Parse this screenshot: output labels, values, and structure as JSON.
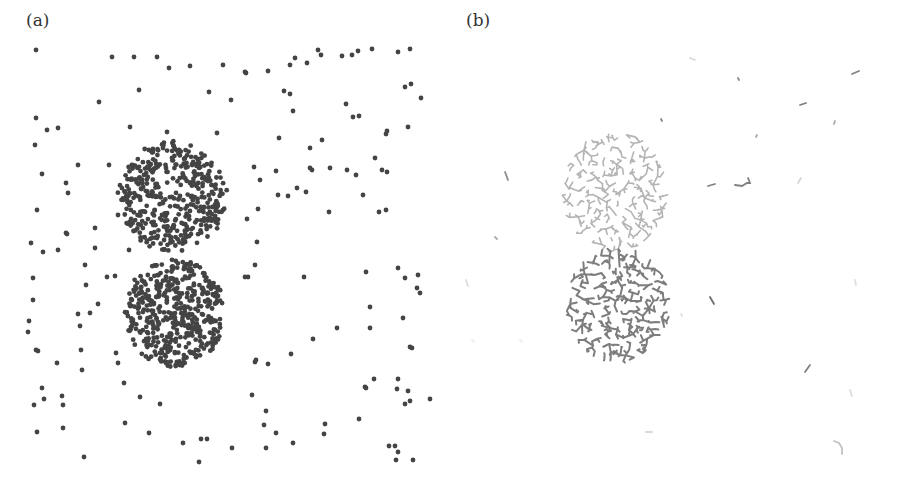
{
  "figure": {
    "panels": [
      {
        "id": "a",
        "label": "(a)"
      },
      {
        "id": "b",
        "label": "(b)"
      }
    ]
  },
  "chart_data": [
    {
      "panel": "(a)",
      "type": "scatter",
      "title": "",
      "xlabel": "",
      "ylabel": "",
      "axes_visible": false,
      "grid": false,
      "point_color": "#444444",
      "point_radius": 2.4,
      "clusters": [
        {
          "name": "upper-cluster",
          "cx": 172,
          "cy": 197,
          "rx": 55,
          "ry": 56,
          "count": 430,
          "seed": 11
        },
        {
          "name": "lower-cluster",
          "cx": 175,
          "cy": 313,
          "rx": 51,
          "ry": 55,
          "count": 460,
          "seed": 29
        }
      ],
      "background_points": [
        [
          36,
          50
        ],
        [
          112,
          57
        ],
        [
          134,
          57
        ],
        [
          157,
          57
        ],
        [
          169,
          68
        ],
        [
          190,
          66
        ],
        [
          223,
          65
        ],
        [
          245,
          72
        ],
        [
          246,
          73
        ],
        [
          268,
          71
        ],
        [
          290,
          65
        ],
        [
          295,
          58
        ],
        [
          307,
          63
        ],
        [
          318,
          50
        ],
        [
          321,
          55
        ],
        [
          342,
          56
        ],
        [
          352,
          55
        ],
        [
          358,
          51
        ],
        [
          372,
          49
        ],
        [
          398,
          52
        ],
        [
          410,
          49
        ],
        [
          139,
          90
        ],
        [
          99,
          102
        ],
        [
          209,
          92
        ],
        [
          231,
          100
        ],
        [
          284,
          91
        ],
        [
          290,
          94
        ],
        [
          293,
          111
        ],
        [
          346,
          104
        ],
        [
          353,
          117
        ],
        [
          359,
          116
        ],
        [
          405,
          87
        ],
        [
          411,
          84
        ],
        [
          421,
          98
        ],
        [
          36,
          118
        ],
        [
          47,
          130
        ],
        [
          58,
          128
        ],
        [
          130,
          127
        ],
        [
          167,
          132
        ],
        [
          217,
          133
        ],
        [
          35,
          145
        ],
        [
          279,
          138
        ],
        [
          310,
          148
        ],
        [
          322,
          140
        ],
        [
          386,
          134
        ],
        [
          387,
          131
        ],
        [
          408,
          127
        ],
        [
          78,
          165
        ],
        [
          109,
          165
        ],
        [
          42,
          174
        ],
        [
          66,
          183
        ],
        [
          68,
          193
        ],
        [
          254,
          167
        ],
        [
          260,
          180
        ],
        [
          278,
          195
        ],
        [
          288,
          196
        ],
        [
          297,
          188
        ],
        [
          306,
          192
        ],
        [
          312,
          170
        ],
        [
          310,
          168
        ],
        [
          330,
          168
        ],
        [
          347,
          170
        ],
        [
          356,
          175
        ],
        [
          363,
          195
        ],
        [
          375,
          158
        ],
        [
          382,
          170
        ],
        [
          387,
          172
        ],
        [
          276,
          171
        ],
        [
          37,
          210
        ],
        [
          118,
          215
        ],
        [
          95,
          228
        ],
        [
          129,
          250
        ],
        [
          67,
          234
        ],
        [
          66,
          233
        ],
        [
          43,
          252
        ],
        [
          58,
          250
        ],
        [
          95,
          248
        ],
        [
          247,
          219
        ],
        [
          257,
          242
        ],
        [
          258,
          209
        ],
        [
          329,
          212
        ],
        [
          379,
          212
        ],
        [
          386,
          210
        ],
        [
          31,
          243
        ],
        [
          33,
          278
        ],
        [
          85,
          265
        ],
        [
          86,
          285
        ],
        [
          98,
          304
        ],
        [
          33,
          300
        ],
        [
          29,
          321
        ],
        [
          28,
          332
        ],
        [
          80,
          326
        ],
        [
          78,
          314
        ],
        [
          90,
          313
        ],
        [
          107,
          277
        ],
        [
          115,
          276
        ],
        [
          255,
          265
        ],
        [
          248,
          277
        ],
        [
          245,
          277
        ],
        [
          304,
          277
        ],
        [
          366,
          272
        ],
        [
          398,
          268
        ],
        [
          405,
          278
        ],
        [
          418,
          275
        ],
        [
          417,
          288
        ],
        [
          420,
          293
        ],
        [
          370,
          307
        ],
        [
          403,
          318
        ],
        [
          313,
          339
        ],
        [
          337,
          328
        ],
        [
          370,
          328
        ],
        [
          410,
          347
        ],
        [
          412,
          348
        ],
        [
          36,
          350
        ],
        [
          38,
          351
        ],
        [
          57,
          363
        ],
        [
          81,
          350
        ],
        [
          82,
          370
        ],
        [
          116,
          353
        ],
        [
          118,
          363
        ],
        [
          256,
          360
        ],
        [
          255,
          362
        ],
        [
          268,
          364
        ],
        [
          291,
          354
        ],
        [
          365,
          387
        ],
        [
          366,
          388
        ],
        [
          42,
          388
        ],
        [
          44,
          399
        ],
        [
          34,
          405
        ],
        [
          62,
          396
        ],
        [
          63,
          405
        ],
        [
          124,
          383
        ],
        [
          140,
          397
        ],
        [
          160,
          404
        ],
        [
          149,
          433
        ],
        [
          252,
          395
        ],
        [
          266,
          411
        ],
        [
          264,
          425
        ],
        [
          276,
          433
        ],
        [
          293,
          443
        ],
        [
          325,
          424
        ],
        [
          324,
          434
        ],
        [
          37,
          432
        ],
        [
          63,
          428
        ],
        [
          125,
          423
        ],
        [
          183,
          443
        ],
        [
          201,
          439
        ],
        [
          207,
          439
        ],
        [
          199,
          462
        ],
        [
          232,
          448
        ],
        [
          266,
          448
        ],
        [
          84,
          457
        ],
        [
          389,
          446
        ],
        [
          395,
          446
        ],
        [
          398,
          452
        ],
        [
          396,
          460
        ],
        [
          413,
          460
        ],
        [
          359,
          419
        ],
        [
          397,
          389
        ],
        [
          405,
          404
        ],
        [
          410,
          401
        ],
        [
          408,
          391
        ],
        [
          374,
          379
        ],
        [
          398,
          379
        ],
        [
          430,
          399
        ]
      ]
    },
    {
      "panel": "(b)",
      "type": "scatter",
      "title": "",
      "xlabel": "",
      "ylabel": "",
      "axes_visible": false,
      "grid": false,
      "description": "Branching tree structures occupying the same regions as the clusters in (a); upper structure light gray, lower structure dark gray, plus isolated short segments.",
      "trees": [
        {
          "name": "upper-tree",
          "cx": 165,
          "cy": 192,
          "rx": 53,
          "ry": 60,
          "color": "#b4b4b4",
          "width": 1.6,
          "nodes": 420,
          "seed": 7
        },
        {
          "name": "lower-tree",
          "cx": 168,
          "cy": 305,
          "rx": 52,
          "ry": 58,
          "color": "#7d7d7d",
          "width": 2.0,
          "nodes": 430,
          "seed": 43
        }
      ],
      "segments": [
        {
          "points": [
            [
              240,
              58
            ],
            [
              245,
              60
            ]
          ],
          "color": "#d8d8d8"
        },
        {
          "points": [
            [
              288,
              78
            ],
            [
              289,
              80
            ]
          ],
          "color": "#8a8a8a"
        },
        {
          "points": [
            [
              402,
              74
            ],
            [
              409,
              71
            ]
          ],
          "color": "#808080"
        },
        {
          "points": [
            [
              350,
              105
            ],
            [
              356,
              103
            ]
          ],
          "color": "#7e7e7e"
        },
        {
          "points": [
            [
              384,
              124
            ],
            [
              385,
              121
            ]
          ],
          "color": "#aaaaaa"
        },
        {
          "points": [
            [
              211,
              119
            ],
            [
              212,
              121
            ]
          ],
          "color": "#8a8a8a"
        },
        {
          "points": [
            [
              306,
              137
            ],
            [
              307,
              135
            ]
          ],
          "color": "#aaaaaa"
        },
        {
          "points": [
            [
              55,
              172
            ],
            [
              58,
              180
            ]
          ],
          "color": "#8a8a8a"
        },
        {
          "points": [
            [
              258,
              186
            ],
            [
              265,
              184
            ]
          ],
          "color": "#7f7f7f"
        },
        {
          "points": [
            [
              285,
              185
            ],
            [
              292,
              186
            ],
            [
              297,
              183
            ],
            [
              300,
              183
            ],
            [
              298,
              178
            ]
          ],
          "color": "#808080"
        },
        {
          "points": [
            [
              348,
              183
            ],
            [
              351,
              178
            ]
          ],
          "color": "#d6d6d6"
        },
        {
          "points": [
            [
              45,
              237
            ],
            [
              47,
              239
            ]
          ],
          "color": "#aaaaaa"
        },
        {
          "points": [
            [
              16,
              280
            ],
            [
              18,
              286
            ]
          ],
          "color": "#dddddd"
        },
        {
          "points": [
            [
              260,
              297
            ],
            [
              264,
              304
            ]
          ],
          "color": "#6e6e6e"
        },
        {
          "points": [
            [
              405,
              280
            ],
            [
              406,
              285
            ]
          ],
          "color": "#e0e0e0"
        },
        {
          "points": [
            [
              355,
              372
            ],
            [
              360,
              365
            ]
          ],
          "color": "#808080"
        },
        {
          "points": [
            [
              400,
              390
            ],
            [
              402,
              396
            ]
          ],
          "color": "#dcdcdc"
        },
        {
          "points": [
            [
              196,
              432
            ],
            [
              202,
              432
            ]
          ],
          "color": "#d8d8d8"
        },
        {
          "points": [
            [
              384,
              441
            ],
            [
              389,
              443
            ],
            [
              392,
              448
            ],
            [
              392,
              454
            ]
          ],
          "color": "#c2c2c2"
        },
        {
          "points": [
            [
              231,
              314
            ],
            [
              232,
              316
            ]
          ],
          "color": "#e2e2e2"
        },
        {
          "points": [
            [
              70,
              340
            ],
            [
              72,
              342
            ]
          ],
          "color": "#eeeeee"
        },
        {
          "points": [
            [
              22,
              340
            ],
            [
              24,
              342
            ]
          ],
          "color": "#eeeeee"
        }
      ]
    }
  ]
}
